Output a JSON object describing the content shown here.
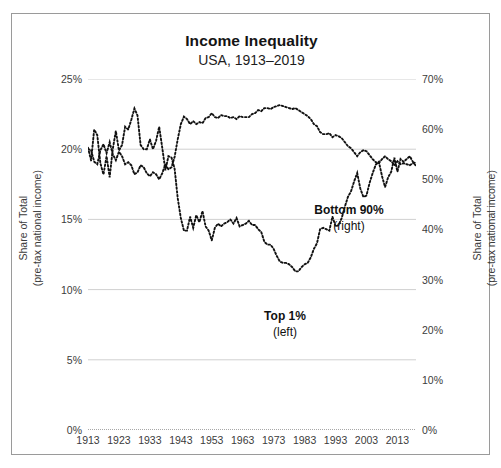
{
  "title": "Income Inequality",
  "subtitle": "USA, 1913–2019",
  "axis": {
    "left_title_line1": "Share of Total",
    "left_title_line2": "(pre-tax national income)",
    "right_title_line1": "Share of Total",
    "right_title_line2": "(pre-tax national income)",
    "left_ticks": [
      "0%",
      "5%",
      "10%",
      "15%",
      "20%",
      "25%"
    ],
    "right_ticks": [
      "0%",
      "10%",
      "20%",
      "30%",
      "40%",
      "50%",
      "60%",
      "70%"
    ],
    "x_ticks": [
      "1913",
      "1923",
      "1933",
      "1943",
      "1953",
      "1963",
      "1973",
      "1983",
      "1993",
      "2003",
      "2013"
    ]
  },
  "labels": {
    "bottom90_main": "Bottom 90%",
    "bottom90_sub": "(right)",
    "top1_main": "Top 1%",
    "top1_sub": "(left)"
  },
  "colors": {
    "line": "#111111",
    "grid": "#d0d0d0",
    "border": "#9a9a9a",
    "text": "#1d1d1d"
  },
  "chart_data": {
    "type": "line",
    "title": "Income Inequality",
    "subtitle": "USA, 1913–2019",
    "xlabel": "",
    "ylabel": "Share of Total (pre-tax national income)",
    "y2label": "Share of Total (pre-tax national income)",
    "xlim": [
      1913,
      2019
    ],
    "ylim": [
      0,
      25
    ],
    "y2lim": [
      0,
      70
    ],
    "yticks": [
      0,
      5,
      10,
      15,
      20,
      25
    ],
    "y2ticks": [
      0,
      10,
      20,
      30,
      40,
      50,
      60,
      70
    ],
    "xticks": [
      1913,
      1923,
      1933,
      1943,
      1953,
      1963,
      1973,
      1983,
      1993,
      2003,
      2013
    ],
    "grid": true,
    "legend": "annotations",
    "linestyle": "dotted",
    "x": [
      1913,
      1914,
      1915,
      1916,
      1917,
      1918,
      1919,
      1920,
      1921,
      1922,
      1923,
      1924,
      1925,
      1926,
      1927,
      1928,
      1929,
      1930,
      1931,
      1932,
      1933,
      1934,
      1935,
      1936,
      1937,
      1938,
      1939,
      1940,
      1941,
      1942,
      1943,
      1944,
      1945,
      1946,
      1947,
      1948,
      1949,
      1950,
      1951,
      1952,
      1953,
      1954,
      1955,
      1956,
      1957,
      1958,
      1959,
      1960,
      1961,
      1962,
      1963,
      1964,
      1965,
      1966,
      1967,
      1968,
      1969,
      1970,
      1971,
      1972,
      1973,
      1974,
      1975,
      1976,
      1977,
      1978,
      1979,
      1980,
      1981,
      1982,
      1983,
      1984,
      1985,
      1986,
      1987,
      1988,
      1989,
      1990,
      1991,
      1992,
      1993,
      1994,
      1995,
      1996,
      1997,
      1998,
      1999,
      2000,
      2001,
      2002,
      2003,
      2004,
      2005,
      2006,
      2007,
      2008,
      2009,
      2010,
      2011,
      2012,
      2013,
      2014,
      2015,
      2016,
      2017,
      2018,
      2019
    ],
    "series": [
      {
        "name": "Top 1%",
        "axis": "left",
        "unit": "%",
        "values": [
          20.1,
          19.2,
          21.4,
          21.0,
          19.0,
          18.2,
          19.5,
          18.0,
          20.0,
          21.3,
          19.9,
          20.3,
          21.6,
          21.4,
          22.1,
          22.9,
          22.4,
          20.3,
          20.0,
          20.0,
          20.7,
          20.0,
          20.6,
          21.6,
          20.1,
          18.5,
          19.5,
          19.4,
          18.6,
          16.5,
          15.1,
          14.2,
          14.2,
          15.2,
          14.4,
          15.3,
          14.8,
          15.6,
          14.5,
          14.2,
          13.5,
          14.4,
          14.7,
          14.5,
          14.7,
          14.8,
          15.0,
          14.7,
          15.1,
          14.5,
          14.6,
          14.7,
          14.9,
          14.6,
          14.6,
          14.3,
          14.1,
          13.4,
          13.2,
          13.2,
          12.9,
          12.4,
          12.0,
          11.9,
          11.9,
          11.8,
          11.6,
          11.3,
          11.3,
          11.6,
          11.8,
          11.9,
          12.3,
          12.9,
          13.3,
          14.3,
          14.4,
          14.3,
          14.2,
          15.2,
          14.5,
          14.6,
          15.1,
          15.9,
          16.6,
          17.0,
          17.7,
          18.3,
          17.2,
          16.6,
          16.7,
          17.6,
          18.3,
          18.9,
          19.1,
          18.1,
          17.3,
          18.0,
          18.4,
          19.4,
          18.4,
          19.3,
          19.1,
          19.3,
          19.5,
          19.1,
          18.8
        ]
      },
      {
        "name": "Bottom 90%",
        "axis": "right",
        "unit": "%",
        "values": [
          56.0,
          55.8,
          53.5,
          53.0,
          55.8,
          57.0,
          55.2,
          57.4,
          55.0,
          53.8,
          55.5,
          54.6,
          53.0,
          53.4,
          52.8,
          51.0,
          51.4,
          52.8,
          52.4,
          51.2,
          50.6,
          51.4,
          51.0,
          50.0,
          51.2,
          53.0,
          52.0,
          52.4,
          54.5,
          58.0,
          61.0,
          62.5,
          62.0,
          61.0,
          61.6,
          61.0,
          61.4,
          61.2,
          62.2,
          62.4,
          63.2,
          62.4,
          62.2,
          62.8,
          62.6,
          62.6,
          62.2,
          62.4,
          62.0,
          62.6,
          62.4,
          62.4,
          62.4,
          63.0,
          63.2,
          63.8,
          63.6,
          64.2,
          64.2,
          64.0,
          64.4,
          64.6,
          64.8,
          64.6,
          64.4,
          64.2,
          64.0,
          64.2,
          63.8,
          63.4,
          63.0,
          62.6,
          62.0,
          61.0,
          60.6,
          59.4,
          59.0,
          59.0,
          59.2,
          58.4,
          58.8,
          58.6,
          58.2,
          57.4,
          56.6,
          56.2,
          55.4,
          54.6,
          55.4,
          55.8,
          55.6,
          54.8,
          54.0,
          53.4,
          53.2,
          54.0,
          54.6,
          54.0,
          53.6,
          52.8,
          53.6,
          53.0,
          53.2,
          53.0,
          52.8,
          53.2,
          53.4
        ]
      }
    ]
  }
}
